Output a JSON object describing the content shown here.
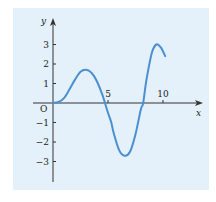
{
  "chart_data": {
    "type": "line",
    "title": "",
    "xlabel": "x",
    "ylabel": "y",
    "origin_label": "O",
    "xlim": [
      0,
      10.8
    ],
    "ylim": [
      -4,
      3.9
    ],
    "x_ticks": [
      {
        "value": 5,
        "label": "5"
      },
      {
        "value": 10,
        "label": "10"
      }
    ],
    "y_ticks": [
      {
        "value": 3,
        "label": "3"
      },
      {
        "value": 2,
        "label": "2"
      },
      {
        "value": 1,
        "label": "1"
      },
      {
        "value": -1,
        "label": "−1"
      },
      {
        "value": -2,
        "label": "−2"
      },
      {
        "value": -3,
        "label": "−3"
      }
    ],
    "grid": false,
    "series": [
      {
        "name": "curve",
        "x": [
          0,
          0.5,
          1,
          1.5,
          2,
          2.5,
          3,
          3.5,
          4,
          4.5,
          5,
          5.3,
          5.5,
          6,
          6.5,
          7,
          7.5,
          8,
          8.2,
          8.5,
          9,
          9.4,
          9.8,
          10.2
        ],
        "y": [
          0,
          0.05,
          0.25,
          0.7,
          1.2,
          1.6,
          1.7,
          1.55,
          1.1,
          0.4,
          -0.5,
          -1.0,
          -1.5,
          -2.4,
          -2.7,
          -2.5,
          -1.6,
          -0.3,
          0,
          1.2,
          2.6,
          3.0,
          2.85,
          2.4
        ]
      }
    ]
  },
  "colors": {
    "background_panel": "#e4f1fa",
    "curve": "#4a8fd0",
    "axis": "#333333"
  }
}
